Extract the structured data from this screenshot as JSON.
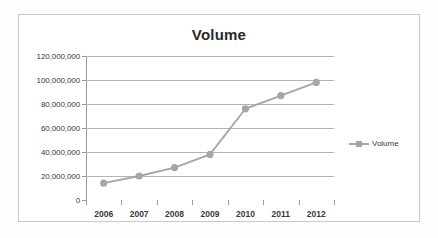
{
  "chart_data": {
    "type": "line",
    "title": "Volume",
    "xlabel": "",
    "ylabel": "",
    "categories": [
      "2006",
      "2007",
      "2008",
      "2009",
      "2010",
      "2011",
      "2012"
    ],
    "series": [
      {
        "name": "Volume",
        "values": [
          14000000,
          20000000,
          27000000,
          38000000,
          76000000,
          87000000,
          98000000
        ]
      }
    ],
    "ylim": [
      0,
      120000000
    ],
    "ytick_values": [
      0,
      20000000,
      40000000,
      60000000,
      80000000,
      100000000,
      120000000
    ],
    "ytick_labels": [
      "0",
      "20,000,000",
      "40,000,000",
      "60,000,000",
      "80,000,000",
      "100,000,000",
      "120,000,000"
    ],
    "grid": true,
    "legend_position": "right",
    "legend_entries": [
      "Volume"
    ],
    "colors": {
      "series_line": "#a6a6a6",
      "marker": "#a6a6a6",
      "gridline": "#b4b4b4",
      "axis": "#9a9a9a",
      "text": "#3a3a3a",
      "title": "#2a2a2a",
      "frame_border": "#c9c9c9",
      "plot_background": "#ffffff"
    }
  },
  "legend": {
    "marker_icon": "line-square-marker-icon"
  }
}
